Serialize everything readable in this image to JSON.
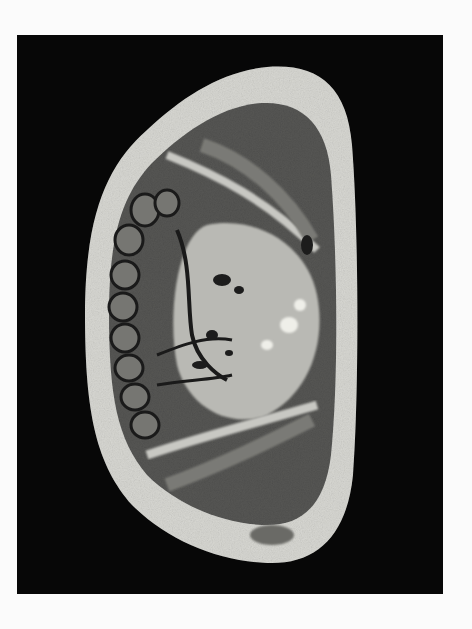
{
  "image": {
    "kind": "photograph",
    "subject": "grayscale anatomical cross-section specimen on black background",
    "colors": {
      "page_background": "#fbfbfb",
      "plate_background": "#070707",
      "skin_fat_layer": "#d6d6d2",
      "muscle_tissue": "#4a4a48",
      "light_tissue": "#bdbdb8",
      "dark_lumen": "#1c1c1c"
    }
  }
}
